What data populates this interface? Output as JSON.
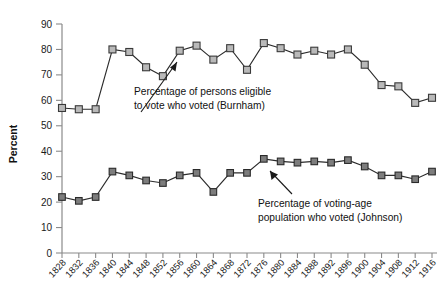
{
  "chart_data": {
    "type": "line",
    "title": "",
    "xlabel": "",
    "ylabel": "Percent",
    "ylim": [
      0,
      90
    ],
    "ytick_labels": [
      "0",
      "10",
      "20",
      "30",
      "40",
      "50",
      "60",
      "70",
      "80",
      "90"
    ],
    "yticks": [
      0,
      10,
      20,
      30,
      40,
      50,
      60,
      70,
      80,
      90
    ],
    "grid": false,
    "legend_position": "inline-annotations",
    "categories": [
      "1828",
      "1832",
      "1836",
      "1840",
      "1844",
      "1848",
      "1852",
      "1856",
      "1860",
      "1864",
      "1868",
      "1872",
      "1876",
      "1880",
      "1884",
      "1888",
      "1892",
      "1896",
      "1900",
      "1904",
      "1908",
      "1912",
      "1916"
    ],
    "x": [
      1828,
      1832,
      1836,
      1840,
      1844,
      1848,
      1852,
      1856,
      1860,
      1864,
      1868,
      1872,
      1876,
      1880,
      1884,
      1888,
      1892,
      1896,
      1900,
      1904,
      1908,
      1912,
      1916
    ],
    "series": [
      {
        "name": "Percentage of persons eligible to vote who voted (Burnham)",
        "short_name": "Burnham",
        "marker": "square-light",
        "values": [
          57,
          56.5,
          56.5,
          80,
          79,
          73,
          69.5,
          79.5,
          81.5,
          76,
          80.5,
          72,
          82.5,
          80.5,
          78,
          79.5,
          78,
          80,
          74,
          66,
          65.5,
          59,
          61
        ]
      },
      {
        "name": "Percentage of voting-age population who voted (Johnson)",
        "short_name": "Johnson",
        "marker": "square-dark",
        "values": [
          22,
          20.5,
          22,
          32,
          30.5,
          28.5,
          27.5,
          30.5,
          31.5,
          24,
          31.5,
          31.5,
          37,
          36,
          35.5,
          36,
          35.5,
          36.5,
          34,
          30.5,
          30.5,
          29,
          32
        ]
      }
    ],
    "annotations": [
      {
        "id": "burnham-annotation",
        "lines": [
          "Percentage of persons eligible",
          "to vote who voted (Burnham)"
        ],
        "points_to": "upper-series"
      },
      {
        "id": "johnson-annotation",
        "lines": [
          "Percentage of voting-age",
          "population who voted (Johnson)"
        ],
        "points_to": "lower-series"
      }
    ],
    "colors": {
      "axis": "#8a8a8a",
      "line": "#2b2b2b",
      "marker_upper_fill": "#b9b9b9",
      "marker_lower_fill": "#7d7d7d",
      "marker_stroke": "#343434",
      "text": "#111111",
      "background": "#ffffff"
    }
  }
}
